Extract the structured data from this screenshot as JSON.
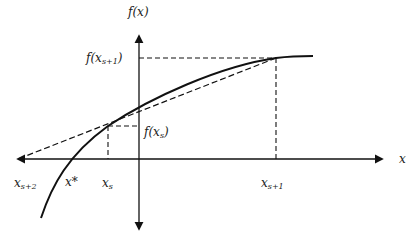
{
  "axes": {
    "x_label": "x",
    "y_label": "f(x)"
  },
  "points": {
    "x_s": {
      "label_base": "x",
      "label_sub": "s"
    },
    "x_s1": {
      "label_base": "x",
      "label_sub": "s+1"
    },
    "x_s2": {
      "label_base": "x",
      "label_sub": "s+2"
    },
    "x_star": {
      "label": "x*"
    }
  },
  "function_values": {
    "f_x_s": {
      "prefix": "f(x",
      "sub": "s",
      "suffix": ")"
    },
    "f_x_s1": {
      "prefix": "f(x",
      "sub": "s+1",
      "suffix": ")"
    }
  },
  "colors": {
    "stroke": "#111111",
    "background": "#ffffff"
  }
}
